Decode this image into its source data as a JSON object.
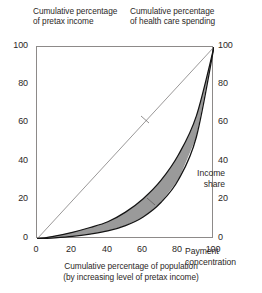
{
  "chart_data": {
    "type": "line",
    "title": "",
    "axis_titles": {
      "left_top": "Cumulative percentage\nof pretax income",
      "right_top": "Cumulative percentage\nof health care spending"
    },
    "xlabel": "Cumulative percentage of population\n(by increasing level of pretax income)",
    "ylabel_left": "Cumulative percentage of pretax income",
    "ylabel_right": "Cumulative percentage of health care spending",
    "xlim": [
      0,
      100
    ],
    "ylim": [
      0,
      100
    ],
    "xticks": [
      "0",
      "20",
      "40",
      "60",
      "80",
      "100"
    ],
    "yticks_left": [
      "100",
      "80",
      "60",
      "40",
      "20",
      "0"
    ],
    "yticks_right": [
      "100",
      "80",
      "60",
      "40",
      "20",
      "0"
    ],
    "grid": false,
    "legend": "inline-annotations",
    "annotations": [
      {
        "label": "Income\nshare",
        "points_to": "upper-curve"
      },
      {
        "label": "Payment\nconcentration",
        "points_to": "lower-curve"
      }
    ],
    "x": [
      0,
      10,
      20,
      30,
      40,
      50,
      60,
      70,
      80,
      90,
      100
    ],
    "series": [
      {
        "name": "Equality line",
        "style": "thin-straight",
        "values": [
          0,
          10,
          20,
          30,
          40,
          50,
          60,
          70,
          80,
          90,
          100
        ]
      },
      {
        "name": "Income share",
        "style": "convex-curve-upper",
        "values": [
          0,
          1.5,
          3.5,
          6,
          9,
          14,
          21,
          30.5,
          44,
          64,
          100
        ]
      },
      {
        "name": "Payment concentration",
        "style": "convex-curve-lower",
        "values": [
          0,
          0.6,
          1.4,
          2.6,
          4.2,
          7,
          11.5,
          19,
          31,
          53,
          100
        ]
      }
    ],
    "shaded_region": {
      "between": [
        "Income share",
        "Payment concentration"
      ],
      "color": "#9a9a9a"
    }
  },
  "colors": {
    "frame": "#8d8a89",
    "curve": "#1a1a1a",
    "fill": "#9a9a9a",
    "text": "#2b2726",
    "reference_line": "#6f6c6b"
  }
}
